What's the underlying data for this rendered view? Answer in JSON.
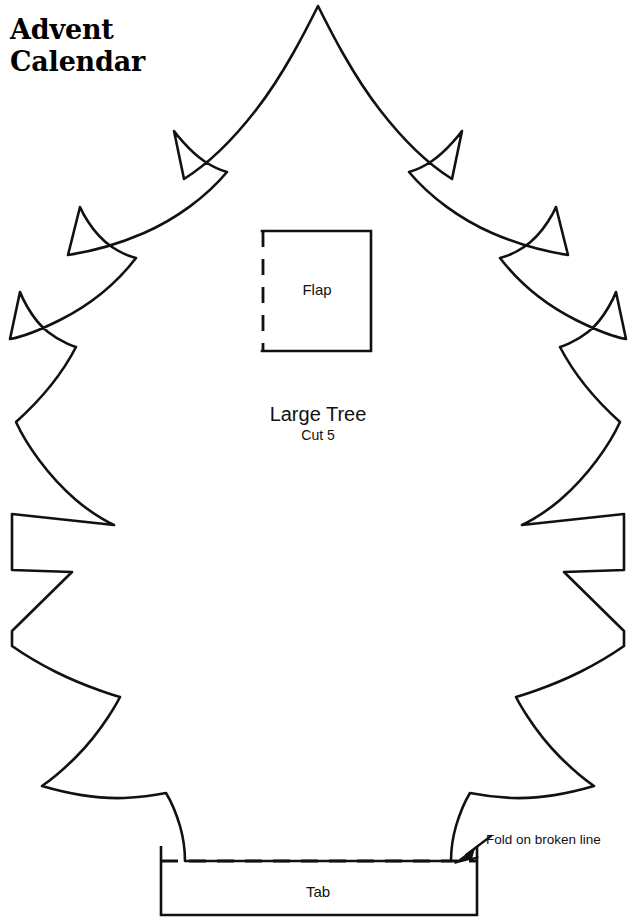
{
  "document": {
    "title_line1": "Advent",
    "title_line2": "Calendar",
    "title": "Advent\nCalendar",
    "background_color": "#ffffff",
    "ink_color": "#000000",
    "page_width": 632,
    "page_height": 920
  },
  "template": {
    "piece_name": "Large Tree",
    "cut_instruction": "Cut 5",
    "flap_label": "Flap",
    "tab_label": "Tab",
    "fold_note": "Fold on broken line"
  },
  "flap": {
    "label": "Flap",
    "x": 262,
    "y": 230,
    "width": 109,
    "height": 121,
    "dashed_edge": "left"
  },
  "tab": {
    "label": "Tab",
    "x": 161,
    "y": 861,
    "width": 316,
    "height": 54,
    "fold_line_y": 861
  },
  "annotation": {
    "text": "Fold on broken line",
    "arrow_from_x": 490,
    "arrow_from_y": 840,
    "arrow_to_x": 457,
    "arrow_to_y": 862
  },
  "line_styles": {
    "cut_line": "solid",
    "fold_line": "dashed",
    "stroke_width": 2.6
  }
}
